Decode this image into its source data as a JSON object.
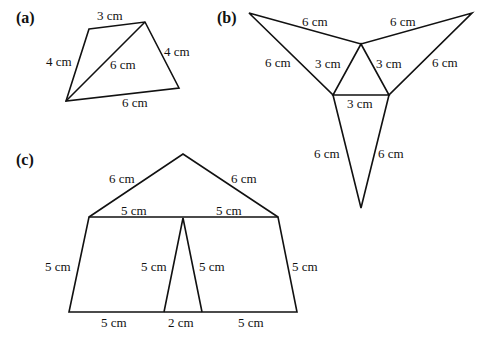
{
  "figures": [
    {
      "id": "a",
      "label": "(a)",
      "shape": "quadrilateral with diagonal",
      "edges": {
        "top": "3 cm",
        "left": "4 cm",
        "right": "4 cm",
        "bottom": "6 cm",
        "diagonal": "6 cm"
      }
    },
    {
      "id": "b",
      "label": "(b)",
      "shape": "equilateral triangle with three attached isosceles triangles (net)",
      "edges": {
        "top_left": "6 cm",
        "top_right": "6 cm",
        "left_outer": "6 cm",
        "right_outer": "6 cm",
        "inner_left": "3 cm",
        "inner_right": "3 cm",
        "inner_bottom": "3 cm",
        "bottom_left": "6 cm",
        "bottom_right": "6 cm"
      }
    },
    {
      "id": "c",
      "label": "(c)",
      "shape": "net of trapezoids and triangles",
      "edges": {
        "roof_left": "6 cm",
        "roof_right": "6 cm",
        "top_left": "5 cm",
        "top_right": "5 cm",
        "side_left": "5 cm",
        "side_right": "5 cm",
        "inner_left": "5 cm",
        "inner_right": "5 cm",
        "bottom_left": "5 cm",
        "bottom_mid": "2 cm",
        "bottom_right": "5 cm"
      }
    }
  ]
}
